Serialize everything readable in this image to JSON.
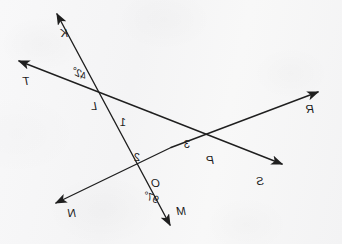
{
  "figure": {
    "ink_color": "#1f1f1f",
    "paper_color": "#f6f6f7",
    "mirrored": "true",
    "ray_endpoint_labels": [
      {
        "name": "K",
        "text": "K",
        "x": 274,
        "y": 28
      },
      {
        "name": "T",
        "text": "T",
        "x": 312,
        "y": 76
      },
      {
        "name": "R",
        "text": "R",
        "x": 28,
        "y": 104
      },
      {
        "name": "S",
        "text": "S",
        "x": 78,
        "y": 176
      },
      {
        "name": "M",
        "text": "M",
        "x": 156,
        "y": 206
      },
      {
        "name": "N",
        "text": "N",
        "x": 266,
        "y": 208
      }
    ],
    "vertex_labels": [
      {
        "name": "L",
        "text": "L",
        "x": 245,
        "y": 101
      },
      {
        "name": "P",
        "text": "P",
        "x": 128,
        "y": 155
      },
      {
        "name": "O",
        "text": "O",
        "x": 182,
        "y": 178
      }
    ],
    "angle_number_labels": [
      {
        "name": "angle-1",
        "text": "1",
        "x": 216,
        "y": 117
      },
      {
        "name": "angle-2",
        "text": "2",
        "x": 202,
        "y": 152
      },
      {
        "name": "angle-3",
        "text": "3",
        "x": 152,
        "y": 139
      }
    ],
    "angle_measure_labels": [
      {
        "name": "angle-42-degrees",
        "text": "42°",
        "x": 255,
        "y": 68
      },
      {
        "name": "angle-97-degrees",
        "text": "97°",
        "x": 183,
        "y": 192
      }
    ],
    "lines": [
      {
        "name": "line-R-N",
        "from_label": "R",
        "to_label": "N",
        "x1": 24,
        "y1": 92,
        "x2": 286,
        "y2": 203
      },
      {
        "name": "line-S-T",
        "from_label": "S",
        "to_label": "T",
        "x1": 60,
        "y1": 164,
        "x2": 323,
        "y2": 61
      },
      {
        "name": "line-M-K",
        "from_label": "M",
        "to_label": "K",
        "x1": 172,
        "y1": 225,
        "x2": 285,
        "y2": 14
      }
    ]
  }
}
